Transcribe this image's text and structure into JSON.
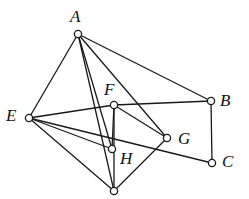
{
  "diagram": {
    "type": "graph",
    "title": "",
    "style": {
      "background": "#ffffff",
      "edge_color": "#1a1a1a",
      "edge_width": 1.3,
      "node_stroke": "#1a1a1a",
      "node_fill": "#ffffff",
      "node_radius": 3.6,
      "label_color": "#111111"
    },
    "nodes": [
      {
        "id": "A",
        "label": "A",
        "x": 78,
        "y": 34,
        "label_x": 70,
        "label_y": 8,
        "labeled": true
      },
      {
        "id": "B",
        "label": "B",
        "x": 211,
        "y": 101,
        "label_x": 220,
        "label_y": 92,
        "labeled": true
      },
      {
        "id": "C",
        "label": "C",
        "x": 212,
        "y": 163,
        "label_x": 222,
        "label_y": 153,
        "labeled": true
      },
      {
        "id": "E",
        "label": "E",
        "x": 29,
        "y": 118,
        "label_x": 6,
        "label_y": 107,
        "labeled": true
      },
      {
        "id": "F",
        "label": "F",
        "x": 114,
        "y": 105,
        "label_x": 104,
        "label_y": 81,
        "labeled": true
      },
      {
        "id": "G",
        "label": "G",
        "x": 167,
        "y": 138,
        "label_x": 178,
        "label_y": 130,
        "labeled": true
      },
      {
        "id": "H",
        "label": "H",
        "x": 112,
        "y": 149,
        "label_x": 120,
        "label_y": 150,
        "labeled": true
      },
      {
        "id": "D",
        "label": "",
        "x": 114,
        "y": 191,
        "label_x": 0,
        "label_y": 0,
        "labeled": false
      }
    ],
    "edges": [
      {
        "from": "A",
        "to": "E"
      },
      {
        "from": "A",
        "to": "B"
      },
      {
        "from": "A",
        "to": "G"
      },
      {
        "from": "A",
        "to": "H"
      },
      {
        "from": "A",
        "to": "D"
      },
      {
        "from": "E",
        "to": "F"
      },
      {
        "from": "E",
        "to": "H"
      },
      {
        "from": "E",
        "to": "C"
      },
      {
        "from": "E",
        "to": "D"
      },
      {
        "from": "F",
        "to": "B"
      },
      {
        "from": "F",
        "to": "G"
      },
      {
        "from": "F",
        "to": "H"
      },
      {
        "from": "F",
        "to": "D"
      },
      {
        "from": "G",
        "to": "D"
      },
      {
        "from": "B",
        "to": "C"
      }
    ]
  }
}
